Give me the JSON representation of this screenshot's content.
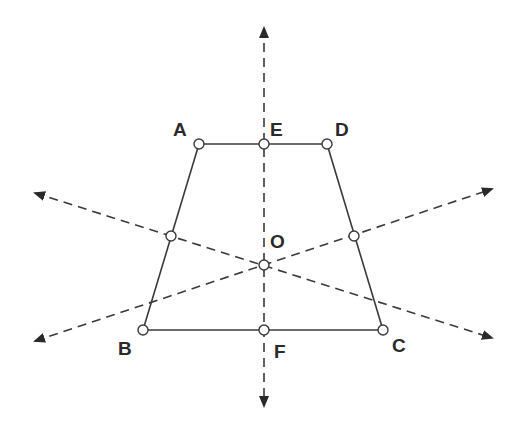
{
  "diagram": {
    "title": "",
    "type": "isosceles-trapezoid-with-symmetry-axes",
    "colors": {
      "stroke": "#3a3a3a",
      "arrow": "#2a2a2a",
      "point_fill": "#ffffff",
      "background": "#ffffff"
    },
    "points": {
      "A": {
        "label": "A",
        "x": 199,
        "y": 144,
        "label_x": 173,
        "label_y": 136
      },
      "E": {
        "label": "E",
        "x": 264,
        "y": 144,
        "label_x": 270,
        "label_y": 136
      },
      "D": {
        "label": "D",
        "x": 327,
        "y": 144,
        "label_x": 335,
        "label_y": 136
      },
      "B": {
        "label": "B",
        "x": 143,
        "y": 330,
        "label_x": 118,
        "label_y": 355
      },
      "F": {
        "label": "F",
        "x": 264,
        "y": 330,
        "label_x": 274,
        "label_y": 358
      },
      "C": {
        "label": "C",
        "x": 383,
        "y": 330,
        "label_x": 392,
        "label_y": 352
      },
      "O": {
        "label": "O",
        "x": 264,
        "y": 265,
        "label_x": 270,
        "label_y": 248
      },
      "M_AB": {
        "label": "",
        "x": 171,
        "y": 236
      },
      "M_CD": {
        "label": "",
        "x": 354,
        "y": 236
      }
    },
    "segments": [
      {
        "name": "AD",
        "from": "A",
        "to": "D"
      },
      {
        "name": "BC",
        "from": "B",
        "to": "C"
      },
      {
        "name": "AB",
        "from": "A",
        "to": "B"
      },
      {
        "name": "DC",
        "from": "D",
        "to": "C"
      }
    ],
    "axes": [
      {
        "name": "vertical-axis-EF",
        "x1": 264,
        "y1": 28,
        "x2": 264,
        "y2": 406
      },
      {
        "name": "diagonal-axis-descending",
        "x1": 35,
        "y1": 193,
        "x2": 492,
        "y2": 338
      },
      {
        "name": "diagonal-axis-ascending",
        "x1": 35,
        "y1": 341,
        "x2": 492,
        "y2": 189
      }
    ]
  }
}
